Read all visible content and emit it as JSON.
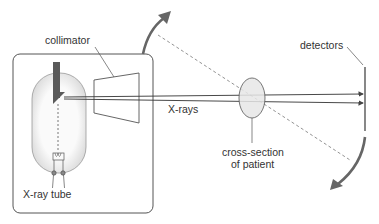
{
  "labels": {
    "collimator": "collimator",
    "xrays": "X-rays",
    "detectors": "detectors",
    "cross_section_line1": "cross-section",
    "cross_section_line2": "of patient",
    "xray_tube": "X-ray tube"
  },
  "colors": {
    "stroke": "#444444",
    "arrow": "#666666",
    "patient_fill": "#e6e6e6",
    "anode": "#5a5a5a",
    "tube_fill": "#f2f2f2"
  }
}
